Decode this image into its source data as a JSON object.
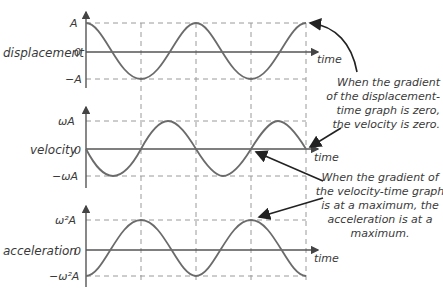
{
  "diagram": {
    "x_label": "time",
    "panels": [
      {
        "name": "displacement",
        "ylabel": "displacement",
        "ticks": {
          "top": "A",
          "zero": "0",
          "bottom": "−A"
        },
        "function": "cos"
      },
      {
        "name": "velocity",
        "ylabel": "velocity",
        "ticks": {
          "top": "ωA",
          "zero": "0",
          "bottom": "−ωA"
        },
        "function": "-sin"
      },
      {
        "name": "acceleration",
        "ylabel": "acceleration",
        "ticks": {
          "top": "ω²A",
          "zero": "0",
          "bottom": "−ω²A"
        },
        "function": "-cos"
      }
    ],
    "annotations": [
      {
        "lines": [
          "When the gradient",
          "of the displacement-",
          "time graph is zero,",
          "the velocity is zero."
        ]
      },
      {
        "lines": [
          "When the gradient of",
          "the velocity-time graph",
          "is at a maximum, the",
          "acceleration is at a",
          "maximum."
        ]
      }
    ],
    "colors": {
      "curve": "#6b6b6b",
      "axis": "#555555",
      "grid": "#9a9a9a",
      "text": "#3a3a3a",
      "arrow": "#222222"
    }
  }
}
